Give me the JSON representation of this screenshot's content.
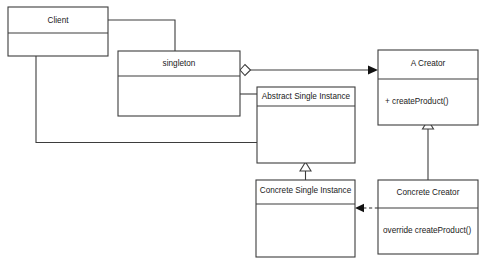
{
  "diagram": {
    "type": "uml-class-diagram",
    "canvas": {
      "width": 490,
      "height": 261
    },
    "colors": {
      "background": "#ffffff",
      "stroke": "#3d3d3d",
      "text": "#1a1a1a",
      "arrow_fill": "#111111"
    },
    "classes": [
      {
        "id": "client",
        "name": "Client",
        "members": [],
        "box": {
          "x": 8,
          "y": 7,
          "w": 100,
          "h": 49,
          "divider_y": 33
        }
      },
      {
        "id": "singleton",
        "name": "singleton",
        "members": [],
        "box": {
          "x": 118,
          "y": 51,
          "w": 122,
          "h": 65,
          "divider_y": 76
        }
      },
      {
        "id": "abstract-single-instance",
        "name": "Abstract Single Instance",
        "members": [],
        "box": {
          "x": 257,
          "y": 87,
          "w": 98,
          "h": 76,
          "divider_y": 106
        }
      },
      {
        "id": "a-creator",
        "name": "A Creator",
        "members": [
          "+ createProduct()"
        ],
        "box": {
          "x": 378,
          "y": 50,
          "w": 100,
          "h": 75,
          "divider_y": 79
        }
      },
      {
        "id": "concrete-single-instance",
        "name": "Concrete Single Instance",
        "members": [],
        "box": {
          "x": 256,
          "y": 180,
          "w": 99,
          "h": 77,
          "divider_y": 204
        }
      },
      {
        "id": "concrete-creator",
        "name": "Concrete Creator",
        "members": [
          "override createProduct()"
        ],
        "box": {
          "x": 378,
          "y": 180,
          "w": 100,
          "h": 74,
          "divider_y": 208
        }
      }
    ],
    "relationships": [
      {
        "id": "client-to-singleton",
        "kind": "association",
        "from": "client",
        "to": "singleton",
        "style": "solid",
        "endpoint": "none"
      },
      {
        "id": "client-to-abstract-single-instance",
        "kind": "association",
        "from": "client",
        "to": "abstract-single-instance",
        "style": "solid",
        "endpoint": "none"
      },
      {
        "id": "singleton-to-abstract-single-instance",
        "kind": "association",
        "from": "singleton",
        "to": "abstract-single-instance",
        "style": "solid",
        "endpoint": "none"
      },
      {
        "id": "singleton-aggregates-a-creator",
        "kind": "aggregation",
        "from": "singleton",
        "to": "a-creator",
        "style": "solid",
        "endpoint": "open-arrow",
        "source_decoration": "hollow-diamond"
      },
      {
        "id": "concrete-single-instance-inherits-abstract",
        "kind": "generalization",
        "from": "concrete-single-instance",
        "to": "abstract-single-instance",
        "style": "solid",
        "endpoint": "hollow-triangle"
      },
      {
        "id": "concrete-creator-inherits-a-creator",
        "kind": "generalization",
        "from": "concrete-creator",
        "to": "a-creator",
        "style": "solid",
        "endpoint": "hollow-triangle"
      },
      {
        "id": "concrete-creator-creates-concrete-single-instance",
        "kind": "dependency",
        "from": "concrete-creator",
        "to": "concrete-single-instance",
        "style": "dashed",
        "endpoint": "solid-arrow"
      }
    ]
  }
}
